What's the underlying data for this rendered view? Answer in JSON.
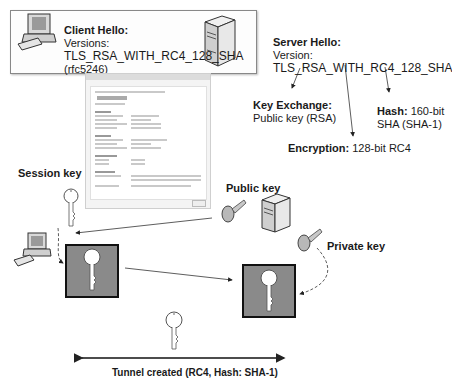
{
  "client_hello": {
    "title": "Client Hello:",
    "line1": "Versions:",
    "line2": "TLS_RSA_WITH_RC4_128_SHA",
    "line3": "(rfc5246)"
  },
  "server_hello": {
    "title": "Server Hello:",
    "line1": "Version:",
    "line2": "TLS_RSA_WITH_RC4_128_SHA"
  },
  "key_exchange": {
    "label": "Key Exchange:",
    "value": "Public key (RSA)"
  },
  "encryption": {
    "label": "Encryption:",
    "value": "128-bit RC4"
  },
  "hash": {
    "label": "Hash:",
    "value1": "160-bit",
    "value2": "SHA (SHA-1)"
  },
  "labels": {
    "session_key": "Session key",
    "public_key": "Public key",
    "private_key": "Private key",
    "tunnel": "Tunnel created (RC4, Hash: SHA-1)"
  },
  "icons": [
    "client-computer-icon",
    "server-icon",
    "certificate-dialog",
    "key-icon",
    "lock-box-icon"
  ],
  "colors": {
    "lockbox_fill": "#8a8a8a",
    "lockbox_border": "#111111",
    "key_fill": "#ffffff",
    "arrow": "#222222"
  }
}
